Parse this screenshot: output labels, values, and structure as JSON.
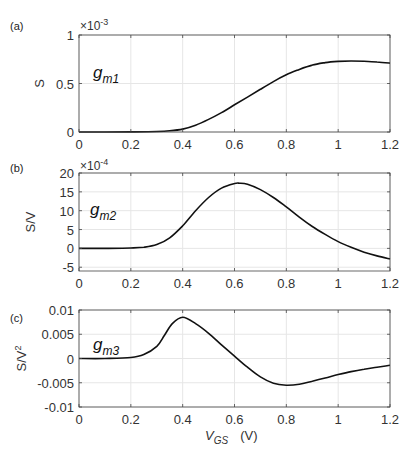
{
  "chart_data": [
    {
      "type": "line",
      "panel": "(a)",
      "series_label": "g",
      "series_sub": "m1",
      "ylabel": "S",
      "exponent_label": "×10",
      "exponent_power": "-3",
      "xlabel": "",
      "xlim": [
        0,
        1.2
      ],
      "ylim": [
        0,
        1
      ],
      "xticks": [
        "0",
        "0.2",
        "0.4",
        "0.6",
        "0.8",
        "1",
        "1.2"
      ],
      "yticks": [
        "0",
        "0.5",
        "1"
      ],
      "grid": true,
      "x": [
        0,
        0.1,
        0.2,
        0.3,
        0.35,
        0.4,
        0.45,
        0.5,
        0.55,
        0.6,
        0.65,
        0.7,
        0.75,
        0.8,
        0.85,
        0.9,
        0.95,
        1.0,
        1.05,
        1.1,
        1.15,
        1.2
      ],
      "values": [
        0,
        0,
        0.001,
        0.005,
        0.012,
        0.03,
        0.07,
        0.13,
        0.2,
        0.28,
        0.36,
        0.44,
        0.52,
        0.59,
        0.645,
        0.69,
        0.715,
        0.728,
        0.732,
        0.73,
        0.722,
        0.71
      ]
    },
    {
      "type": "line",
      "panel": "(b)",
      "series_label": "g",
      "series_sub": "m2",
      "ylabel": "S/V",
      "exponent_label": "×10",
      "exponent_power": "-4",
      "xlabel": "",
      "xlim": [
        0,
        1.2
      ],
      "ylim": [
        -6,
        20
      ],
      "xticks": [
        "0",
        "0.2",
        "0.4",
        "0.6",
        "0.8",
        "1",
        "1.2"
      ],
      "yticks": [
        "-5",
        "0",
        "5",
        "10",
        "15",
        "20"
      ],
      "grid": true,
      "x": [
        0,
        0.1,
        0.2,
        0.25,
        0.3,
        0.35,
        0.4,
        0.45,
        0.5,
        0.55,
        0.6,
        0.62,
        0.65,
        0.7,
        0.75,
        0.8,
        0.85,
        0.9,
        0.95,
        1.0,
        1.05,
        1.1,
        1.15,
        1.2
      ],
      "values": [
        0,
        0,
        0.1,
        0.3,
        1.0,
        2.8,
        6.0,
        10.0,
        13.5,
        16.0,
        17.2,
        17.3,
        17.0,
        15.6,
        13.5,
        11.0,
        8.3,
        5.8,
        3.7,
        1.8,
        0.3,
        -1.0,
        -2.0,
        -2.8
      ]
    },
    {
      "type": "line",
      "panel": "(c)",
      "series_label": "g",
      "series_sub": "m3",
      "ylabel": "S/V",
      "ylabel_power": "2",
      "exponent_label": "",
      "exponent_power": "",
      "xlabel": "V",
      "xlabel_sub": "GS",
      "xlabel_unit": "(V)",
      "xlim": [
        0,
        1.2
      ],
      "ylim": [
        -0.01,
        0.01
      ],
      "xticks": [
        "0",
        "0.2",
        "0.4",
        "0.6",
        "0.8",
        "1",
        "1.2"
      ],
      "yticks": [
        "-0.01",
        "-0.005",
        "0",
        "0.005",
        "0.01"
      ],
      "grid": true,
      "x": [
        0,
        0.1,
        0.2,
        0.25,
        0.3,
        0.33,
        0.36,
        0.4,
        0.45,
        0.5,
        0.55,
        0.6,
        0.65,
        0.7,
        0.75,
        0.8,
        0.85,
        0.9,
        0.95,
        1.0,
        1.05,
        1.1,
        1.15,
        1.2
      ],
      "values": [
        0,
        0,
        0.0002,
        0.0008,
        0.0025,
        0.0048,
        0.0072,
        0.0085,
        0.0072,
        0.0052,
        0.0028,
        0.0005,
        -0.0018,
        -0.0038,
        -0.0051,
        -0.0055,
        -0.0053,
        -0.0047,
        -0.004,
        -0.0033,
        -0.0027,
        -0.0022,
        -0.0018,
        -0.0014
      ]
    }
  ]
}
